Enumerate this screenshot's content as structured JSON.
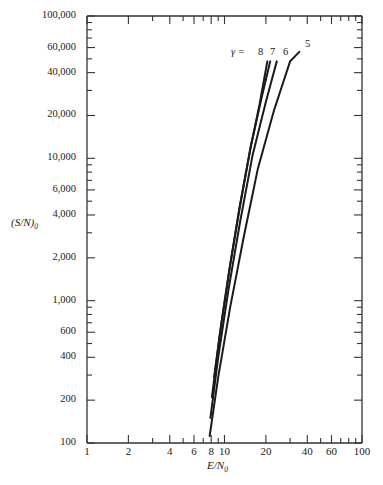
{
  "figure": {
    "background_color": "#ffffff",
    "line_color": "#1a1a1a",
    "axis_color": "#333333"
  },
  "axes": {
    "y_title": "(S/N)",
    "y_title_sub": "0",
    "x_title": "E/N",
    "x_title_sub": "0",
    "y_ticks": [
      "100",
      "200",
      "400",
      "600",
      "1,000",
      "2,000",
      "4,000",
      "6,000",
      "10,000",
      "20,000",
      "40,000",
      "60,000",
      "100,000"
    ],
    "x_ticks": [
      "1",
      "2",
      "4",
      "6",
      "8",
      "10",
      "20",
      "40",
      "60",
      "100"
    ]
  },
  "annotations": {
    "gamma_prefix": "γ =",
    "curve_labels": [
      "8",
      "7",
      "6",
      "5"
    ]
  },
  "chart_data": {
    "type": "line",
    "title": "",
    "xlabel": "E/N0",
    "ylabel": "(S/N)0",
    "xscale": "log",
    "yscale": "log",
    "xlim": [
      1,
      100
    ],
    "ylim": [
      100,
      100000
    ],
    "grid": false,
    "legend": "inline-end-labels",
    "x_tick_values": [
      1,
      2,
      4,
      6,
      8,
      10,
      20,
      40,
      60,
      100
    ],
    "x_tick_labels": [
      "1",
      "2",
      "4",
      "6",
      "8",
      "10",
      "20",
      "40",
      "60",
      "100"
    ],
    "x_minor_ticks": [
      3,
      5,
      7,
      9,
      30,
      50,
      70,
      80,
      90
    ],
    "y_tick_values": [
      100,
      200,
      400,
      600,
      1000,
      2000,
      4000,
      6000,
      10000,
      20000,
      40000,
      60000,
      100000
    ],
    "y_tick_labels": [
      "100",
      "200",
      "400",
      "600",
      "1,000",
      "2,000",
      "4,000",
      "6,000",
      "10,000",
      "20,000",
      "40,000",
      "60,000",
      "100,000"
    ],
    "y_minor_ticks": [
      300,
      500,
      700,
      800,
      900,
      3000,
      5000,
      7000,
      8000,
      9000,
      30000,
      50000,
      70000,
      80000,
      90000
    ],
    "series": [
      {
        "name": "γ = 8",
        "label": "8",
        "points": [
          [
            8.4,
            290
          ],
          [
            9.5,
            700
          ],
          [
            11.0,
            1800
          ],
          [
            13.0,
            4800
          ],
          [
            15.5,
            12000
          ],
          [
            18.0,
            24000
          ],
          [
            20.5,
            48000
          ]
        ]
      },
      {
        "name": "γ = 7",
        "label": "7",
        "points": [
          [
            8.1,
            210
          ],
          [
            9.2,
            560
          ],
          [
            10.8,
            1600
          ],
          [
            12.8,
            4300
          ],
          [
            15.5,
            12000
          ],
          [
            18.5,
            26000
          ],
          [
            21.5,
            48000
          ]
        ]
      },
      {
        "name": "γ = 6",
        "label": "6",
        "points": [
          [
            7.9,
            150
          ],
          [
            9.0,
            400
          ],
          [
            10.7,
            1200
          ],
          [
            13.0,
            3600
          ],
          [
            16.0,
            10500
          ],
          [
            20.0,
            25000
          ],
          [
            24.0,
            48000
          ]
        ]
      },
      {
        "name": "γ = 5",
        "label": "5",
        "points": [
          [
            7.8,
            112
          ],
          [
            9.0,
            290
          ],
          [
            11.0,
            900
          ],
          [
            13.8,
            2800
          ],
          [
            17.5,
            8500
          ],
          [
            23.0,
            22000
          ],
          [
            30.0,
            48000
          ],
          [
            35.0,
            56000
          ]
        ]
      }
    ]
  }
}
